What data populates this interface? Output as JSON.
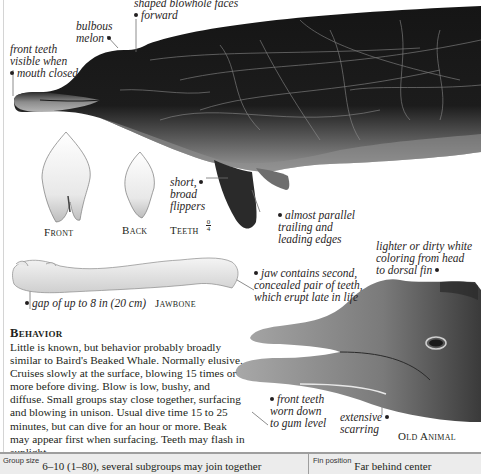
{
  "illustration": {
    "callouts": {
      "blowhole": "shaped blowhole faces\nforward",
      "blowhole_line1": "shaped blowhole faces",
      "blowhole_line2": "forward",
      "melon_line1": "bulbous",
      "melon_line2": "melon",
      "front_teeth_line1": "front teeth",
      "front_teeth_line2": "visible when",
      "front_teeth_line3": "mouth closed",
      "flippers_line1": "short,",
      "flippers_line2": "broad",
      "flippers_line3": "flippers",
      "edges_line1": "almost parallel",
      "edges_line2": "trailing and",
      "edges_line3": "leading edges",
      "jaw_line1": "jaw contains second,",
      "jaw_line2": "concealed pair of teeth,",
      "jaw_line3": "which erupt late in life",
      "gap": "gap of up to 8 in (20 cm)",
      "coloring_line1": "lighter or dirty white",
      "coloring_line2": "coloring from head",
      "coloring_line3": "to dorsal fin",
      "worn_line1": "front teeth",
      "worn_line2": "worn down",
      "worn_line3": "to gum level",
      "scarring_line1": "extensive",
      "scarring_line2": "scarring"
    },
    "captions": {
      "front": "Front",
      "back": "Back",
      "teeth": "Teeth",
      "teeth_upper": "0",
      "teeth_lower": "4",
      "jawbone": "Jawbone",
      "old_animal": "Old Animal"
    }
  },
  "behavior": {
    "heading": "Behavior",
    "text": "Little is known, but behavior probably broadly similar to Baird's Beaked Whale. Normally elusive. Cruises slowly at the surface, blowing 15 times or more before diving. Blow is low, bushy, and diffuse. Small groups stay close together, surfacing and blowing in unison. Usual dive time 15 to 25 minutes, but can dive for an hour or more. Beak may appear first when surfacing. Teeth may flash in sunlight."
  },
  "footer": {
    "group_size_label": "Group size",
    "group_size_value": "6–10 (1–80), several subgroups may join together",
    "fin_position_label": "Fin position",
    "fin_position_value": "Far behind center"
  }
}
